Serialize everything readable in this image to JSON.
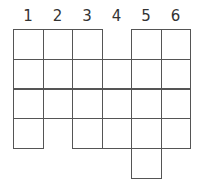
{
  "diagram": {
    "type": "grid-net",
    "column_labels": [
      "1",
      "2",
      "3",
      "4",
      "5",
      "6"
    ],
    "line_color": "#555555",
    "label_color": "#333333",
    "cells": [
      {
        "row": 0,
        "col": 0
      },
      {
        "row": 0,
        "col": 1
      },
      {
        "row": 0,
        "col": 2
      },
      {
        "row": 0,
        "col": 4
      },
      {
        "row": 0,
        "col": 5
      },
      {
        "row": 1,
        "col": 0
      },
      {
        "row": 1,
        "col": 1
      },
      {
        "row": 1,
        "col": 2
      },
      {
        "row": 1,
        "col": 3
      },
      {
        "row": 1,
        "col": 4
      },
      {
        "row": 1,
        "col": 5
      },
      {
        "row": 2,
        "col": 0
      },
      {
        "row": 2,
        "col": 1
      },
      {
        "row": 2,
        "col": 2
      },
      {
        "row": 2,
        "col": 3
      },
      {
        "row": 2,
        "col": 4
      },
      {
        "row": 2,
        "col": 5
      },
      {
        "row": 3,
        "col": 0
      },
      {
        "row": 3,
        "col": 2
      },
      {
        "row": 3,
        "col": 3
      },
      {
        "row": 3,
        "col": 4
      },
      {
        "row": 3,
        "col": 5
      },
      {
        "row": 4,
        "col": 4
      }
    ]
  }
}
